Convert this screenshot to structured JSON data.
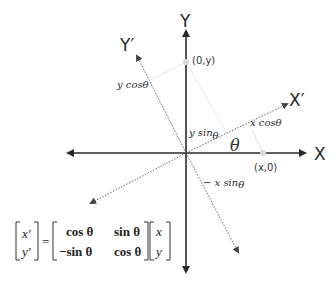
{
  "diagram": {
    "axes": {
      "x_label": "X",
      "y_label": "Y",
      "x_prime_label": "X′",
      "y_prime_label": "Y′"
    },
    "points": {
      "x_point": "(x,0)",
      "y_point": "(0,y)"
    },
    "projections": {
      "y_cos": "y cos",
      "y_sin": "y sin",
      "x_cos": "x cos",
      "neg_x_sin": "− x sin",
      "theta": "θ"
    },
    "angle_label": "θ",
    "equation": {
      "lhs": [
        "x'",
        "y'"
      ],
      "equals": "=",
      "matrix": [
        [
          "cos θ",
          "sin θ"
        ],
        [
          "−sin θ",
          "cos θ"
        ]
      ],
      "rhs": [
        "x",
        "y"
      ]
    },
    "colors": {
      "axis": "#2a2a2a",
      "dotted_axis": "#555555",
      "projection_line": "#e6e6e6",
      "point_marker": "#d8d8d8"
    }
  }
}
